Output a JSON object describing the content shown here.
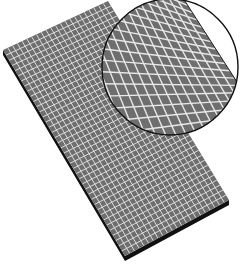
{
  "illustration": {
    "subject": "grid mesh sheet with magnified detail",
    "colors": {
      "background": "#ffffff",
      "panel_fill": "#6e6e6e",
      "grid_lines": "#e8e8e8",
      "panel_edge": "#111111",
      "magnifier_outline": "#111111"
    },
    "grid": {
      "columns": 22,
      "rows": 40
    },
    "magnifier": {
      "grid_columns": 13,
      "grid_rows": 20
    }
  }
}
